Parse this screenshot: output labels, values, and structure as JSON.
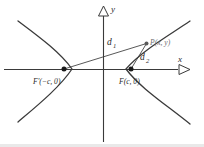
{
  "figure": {
    "axes": {
      "x_label": "x",
      "y_label": "y",
      "x_arrow_icon": "triangle-right-outline",
      "y_arrow_icon": "triangle-up-outline"
    },
    "points": [
      {
        "id": "left-focus",
        "label_main": "F'(",
        "label_coords": "−c, 0)",
        "label_full": "F'(−c, 0)",
        "x": 64,
        "y": 69
      },
      {
        "id": "right-focus",
        "label_main": "F(",
        "label_coords": "c, 0)",
        "label_full": "F(c, 0)",
        "x": 131,
        "y": 69
      },
      {
        "id": "point-p",
        "label_full": "P(x, y)",
        "x": 146,
        "y": 43
      }
    ],
    "segments": [
      {
        "id": "d1",
        "label_base": "d",
        "label_sub": "1",
        "from": "left-focus",
        "to": "point-p"
      },
      {
        "id": "d2",
        "label_base": "d",
        "label_sub": "2",
        "from": "right-focus",
        "to": "point-p"
      }
    ],
    "curve": {
      "type": "hyperbola",
      "branches": [
        "left-branch",
        "right-branch"
      ],
      "stroke_color": "#3a3a3a"
    },
    "colors": {
      "ink": "#2b2b2b",
      "curve": "#3a3a3a",
      "axis": "#3a3a3a",
      "muted_text": "#6e6e6e",
      "background": "#ffffff"
    }
  }
}
